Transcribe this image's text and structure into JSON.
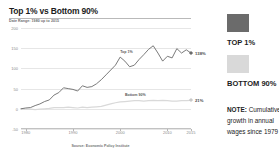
{
  "chart": {
    "title": "Top 1% vs Bottom 90%",
    "subtitle": "Date Range: 1980 up to 2015",
    "source": "Source: Economic Policy Institute"
  },
  "legend": {
    "top_label": "TOP 1%",
    "bottom_label": "BOTTOM 90%",
    "top_color": "#6b6b6b",
    "bottom_color": "#d9d9d9"
  },
  "note": {
    "prefix": "NOTE:",
    "text": " Cumulative growth in annual wages since 1979"
  },
  "annotations": {
    "top_inline": "Top 1%",
    "bottom_inline": "Bottom 90%",
    "top_end_value": "138%",
    "bottom_end_value": "21%"
  },
  "chart_data": {
    "type": "line",
    "title": "Top 1% vs Bottom 90%",
    "subtitle": "Date Range: 1980 up to 2015",
    "xlabel": "",
    "ylabel": "",
    "xlim": [
      1979,
      2015
    ],
    "ylim": [
      -50,
      200
    ],
    "yticks": [
      200,
      150,
      100,
      50,
      0,
      -50
    ],
    "ytick_labels": [
      "200",
      "150",
      "100",
      "50",
      "0",
      "-50"
    ],
    "xticks": [
      1980,
      1990,
      2000,
      2010,
      2015
    ],
    "xtick_labels": [
      "1980",
      "1990",
      "2000",
      "2010",
      "2015"
    ],
    "grid": true,
    "legend_position": "right",
    "source": "Source: Economic Policy Institute",
    "x": [
      1979,
      1980,
      1981,
      1982,
      1983,
      1984,
      1985,
      1986,
      1987,
      1988,
      1989,
      1990,
      1991,
      1992,
      1993,
      1994,
      1995,
      1996,
      1997,
      1998,
      1999,
      2000,
      2001,
      2002,
      2003,
      2004,
      2005,
      2006,
      2007,
      2008,
      2009,
      2010,
      2011,
      2012,
      2013,
      2014,
      2015
    ],
    "series": [
      {
        "name": "Top 1%",
        "color": "#6b6b6b",
        "end_value_label": "138%",
        "values": [
          0,
          2,
          3,
          8,
          12,
          18,
          22,
          34,
          40,
          52,
          50,
          48,
          44,
          57,
          53,
          55,
          62,
          72,
          84,
          96,
          108,
          128,
          118,
          104,
          108,
          122,
          134,
          147,
          156,
          138,
          118,
          130,
          126,
          149,
          138,
          146,
          138
        ]
      },
      {
        "name": "Bottom 90%",
        "color": "#d9d9d9",
        "end_value_label": "21%",
        "values": [
          0,
          -1,
          -1,
          -2,
          -1,
          0,
          1,
          3,
          3,
          3,
          4,
          3,
          2,
          4,
          3,
          4,
          5,
          6,
          9,
          12,
          15,
          17,
          18,
          19,
          20,
          20,
          19,
          20,
          21,
          20,
          21,
          20,
          19,
          19,
          20,
          20,
          21
        ]
      }
    ]
  }
}
